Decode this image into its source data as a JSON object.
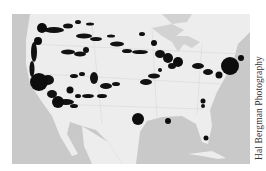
{
  "figure": {
    "type": "map",
    "region": "Continental United States",
    "credit": "Hal Bergman Photography",
    "colors": {
      "ocean": "#c9c9c9",
      "land": "#ededed",
      "lakes": "#d2d2d2",
      "markers": "#111111",
      "roads": "#d9d9d9"
    }
  },
  "markers": [
    {
      "label": "seattle",
      "x": 30,
      "y": 14,
      "r": 5
    },
    {
      "label": "portland",
      "x": 26,
      "y": 27,
      "r": 4
    },
    {
      "label": "san-francisco-bay",
      "x": 27,
      "y": 68,
      "r": 9
    },
    {
      "label": "los-angeles",
      "x": 46,
      "y": 88,
      "r": 6
    },
    {
      "label": "las-vegas",
      "x": 58,
      "y": 76,
      "r": 3.5
    },
    {
      "label": "houston",
      "x": 126,
      "y": 105,
      "r": 6
    },
    {
      "label": "new-orleans",
      "x": 156,
      "y": 107,
      "r": 3
    },
    {
      "label": "miami",
      "x": 194,
      "y": 124,
      "r": 2.5
    },
    {
      "label": "new-york",
      "x": 218,
      "y": 52,
      "r": 9
    },
    {
      "label": "boston",
      "x": 229,
      "y": 44,
      "r": 3
    },
    {
      "label": "philadelphia",
      "x": 207,
      "y": 61,
      "r": 3.5
    },
    {
      "label": "chicago",
      "x": 166,
      "y": 48,
      "r": 5
    },
    {
      "label": "milwaukee",
      "x": 142,
      "y": 29,
      "r": 3
    },
    {
      "label": "atlanta",
      "x": 191,
      "y": 87,
      "r": 2.5
    }
  ]
}
